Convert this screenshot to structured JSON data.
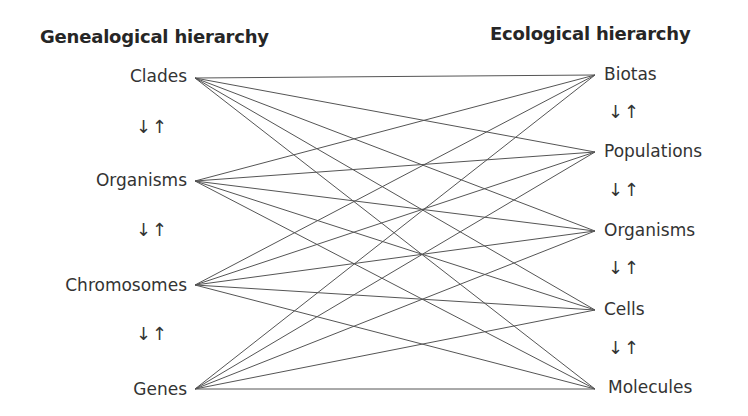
{
  "left_column": {
    "title": "Genealogical hierarchy",
    "nodes": [
      {
        "label": "Clades",
        "y": 78
      },
      {
        "label": "Organisms",
        "y": 181
      },
      {
        "label": "Chromosomes",
        "y": 285
      },
      {
        "label": "Genes",
        "y": 389
      }
    ],
    "arrows": "↓↑",
    "anchor_x": 195
  },
  "right_column": {
    "title": "Ecological hierarchy",
    "nodes": [
      {
        "label": "Biotas",
        "y": 75
      },
      {
        "label": "Populations",
        "y": 152
      },
      {
        "label": "Organisms",
        "y": 231
      },
      {
        "label": "Cells",
        "y": 310
      },
      {
        "label": "Molecules",
        "y": 389
      }
    ],
    "arrows": "↓↑",
    "anchor_x": 595
  },
  "connections": "all-to-all",
  "line_color": "#555555"
}
